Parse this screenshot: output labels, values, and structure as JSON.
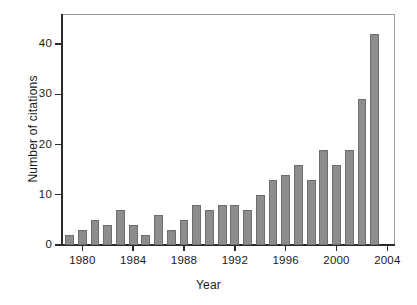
{
  "chart_data": {
    "type": "bar",
    "title": "",
    "xlabel": "Year",
    "ylabel": "Number of citations",
    "categories": [
      "1979",
      "1980",
      "1981",
      "1982",
      "1983",
      "1984",
      "1985",
      "1986",
      "1987",
      "1988",
      "1989",
      "1990",
      "1991",
      "1992",
      "1993",
      "1994",
      "1995",
      "1996",
      "1997",
      "1998",
      "1999",
      "2000",
      "2001",
      "2002",
      "2003"
    ],
    "values": [
      2,
      3,
      5,
      4,
      7,
      4,
      2,
      6,
      3,
      5,
      8,
      7,
      8,
      8,
      7,
      10,
      13,
      14,
      16,
      13,
      19,
      16,
      19,
      29,
      42
    ],
    "xtick_labels": [
      "1980",
      "1984",
      "1988",
      "1992",
      "1996",
      "2000",
      "2004"
    ],
    "xtick_values": [
      1980,
      1984,
      1988,
      1992,
      1996,
      2000,
      2004
    ],
    "ytick_labels": [
      "0",
      "10",
      "20",
      "30",
      "40"
    ],
    "ytick_values": [
      0,
      10,
      20,
      30,
      40
    ],
    "ylim": [
      0,
      46
    ],
    "xlim": [
      1978.4,
      2004.6
    ],
    "grid": false,
    "legend": false,
    "bar_color": "#8d8d8d",
    "bar_edge_color": "#6e6e6e",
    "axis_color": "#2b2b2b",
    "background_color": "#ffffff"
  }
}
